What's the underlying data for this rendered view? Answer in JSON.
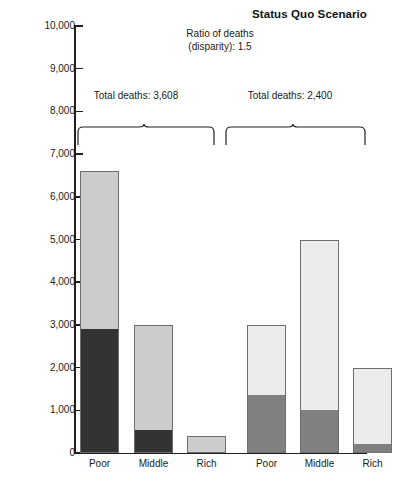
{
  "chart": {
    "title": "Status Quo Scenario",
    "ratio_note_line1": "Ratio of deaths",
    "ratio_note_line2": "(disparity): 1.5",
    "group1_total": "Total deaths: 3,608",
    "group2_total": "Total deaths: 2,400"
  },
  "chart_data": {
    "type": "bar",
    "subtype": "stacked",
    "title": "Status Quo Scenario",
    "xlabel": "",
    "ylabel": "",
    "ylim": [
      0,
      10000
    ],
    "ytick_values": [
      0,
      1000,
      2000,
      3000,
      4000,
      5000,
      6000,
      7000,
      8000,
      9000,
      10000
    ],
    "ytick_labels": [
      "0",
      "1,000",
      "2,000",
      "3,000",
      "4,000",
      "5,000",
      "6,000",
      "7,000",
      "8,000",
      "9,000",
      "10,000"
    ],
    "grid": false,
    "legend": "none",
    "categories": [
      "Poor",
      "Middle",
      "Rich",
      "Poor",
      "Middle",
      "Rich"
    ],
    "groups": [
      {
        "name": "Group 1",
        "total_label": "Total deaths: 3,608",
        "bars": [
          {
            "category": "Poor",
            "total": 6600,
            "lower": 2900,
            "upper": 3700,
            "lower_color": "#333333",
            "upper_color": "#cccccc"
          },
          {
            "category": "Middle",
            "total": 3000,
            "lower": 550,
            "upper": 2450,
            "lower_color": "#333333",
            "upper_color": "#cccccc"
          },
          {
            "category": "Rich",
            "total": 400,
            "lower": 0,
            "upper": 400,
            "lower_color": "#333333",
            "upper_color": "#cccccc"
          }
        ]
      },
      {
        "name": "Group 2",
        "total_label": "Total deaths: 2,400",
        "bars": [
          {
            "category": "Poor",
            "total": 3000,
            "lower": 1350,
            "upper": 1650,
            "lower_color": "#808080",
            "upper_color": "#ececec"
          },
          {
            "category": "Middle",
            "total": 5000,
            "lower": 1000,
            "upper": 4000,
            "lower_color": "#808080",
            "upper_color": "#ececec"
          },
          {
            "category": "Rich",
            "total": 2000,
            "lower": 200,
            "upper": 1800,
            "lower_color": "#808080",
            "upper_color": "#ececec"
          }
        ]
      }
    ],
    "annotations": [
      {
        "text": "Ratio of deaths (disparity): 1.5"
      },
      {
        "text": "Total deaths: 3,608"
      },
      {
        "text": "Total deaths: 2,400"
      }
    ],
    "colors": {
      "dark": "#333333",
      "light_gray": "#cccccc",
      "medium_gray": "#808080",
      "pale_gray": "#ececec",
      "axis": "#231f20",
      "bar_outline": "#6e6e6e"
    }
  }
}
